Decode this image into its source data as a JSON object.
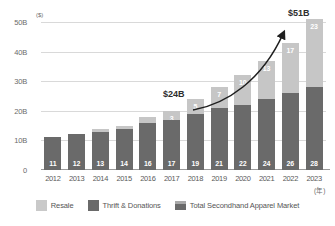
{
  "chart_data": {
    "type": "bar",
    "title": "",
    "subtitle": "",
    "xlabel": "(年)",
    "ylabel": "($)",
    "ylim": [
      0,
      50
    ],
    "yticks": [
      "0",
      "10B",
      "20B",
      "30B",
      "40B",
      "50B"
    ],
    "ytick_values": [
      0,
      10,
      20,
      30,
      40,
      50
    ],
    "grid": true,
    "stacked": true,
    "legend_position": "bottom",
    "categories": [
      "2012",
      "2013",
      "2014",
      "2015",
      "2016",
      "2017",
      "2018",
      "2019",
      "2020",
      "2021",
      "2022",
      "2023"
    ],
    "series": [
      {
        "name": "Thrift & Donations",
        "color": "#6a6a6a",
        "values": [
          11,
          12,
          13,
          14,
          16,
          17,
          19,
          21,
          22,
          24,
          26,
          28
        ],
        "labels": [
          "11",
          "12",
          "13",
          "14",
          "16",
          "17",
          "19",
          "21",
          "22",
          "24",
          "26",
          "28"
        ]
      },
      {
        "name": "Resale",
        "color": "#c6c6c6",
        "values": [
          0,
          0,
          1,
          1,
          2,
          3,
          5,
          7,
          10,
          13,
          17,
          23
        ],
        "labels": [
          "",
          "",
          "",
          "",
          "",
          "3",
          "5",
          "7",
          "10",
          "13",
          "17",
          "23"
        ]
      }
    ],
    "totals": [
      11,
      12,
      14,
      15,
      18,
      20,
      24,
      28,
      32,
      37,
      43,
      51
    ],
    "annotations": [
      {
        "text": "$24B",
        "category": "2018",
        "value": 24
      },
      {
        "text": "$51B",
        "category": "2023",
        "value": 51
      }
    ],
    "legend": [
      {
        "label": "Resale",
        "color": "#c9c9c9",
        "icon": "square-swatch-light"
      },
      {
        "label": "Thrift & Donations",
        "color": "#6a6a6a",
        "icon": "square-swatch-dark"
      },
      {
        "label": "Total Secondhand Apparel Market",
        "color": "#6a6a6a",
        "icon": "square-swatch-stacked"
      }
    ]
  },
  "axis": {
    "y_unit": "($)",
    "x_unit": "(年)",
    "ticks": [
      {
        "label": "50B"
      },
      {
        "label": "40B"
      },
      {
        "label": "30B"
      },
      {
        "label": "20B"
      },
      {
        "label": "10B"
      },
      {
        "label": "0"
      }
    ]
  },
  "callouts": {
    "start": "$24B",
    "end": "$51B"
  },
  "legend": {
    "items": [
      {
        "label": "Resale"
      },
      {
        "label": "Thrift & Donations"
      },
      {
        "label": "Total Secondhand Apparel Market"
      }
    ]
  }
}
